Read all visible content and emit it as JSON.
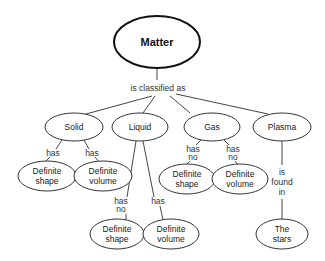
{
  "diagram": {
    "root": {
      "label": "Matter"
    },
    "root_link": {
      "label": "is classified as"
    },
    "categories": [
      {
        "label": "Solid"
      },
      {
        "label": "Liquid"
      },
      {
        "label": "Gas"
      },
      {
        "label": "Plasma"
      }
    ],
    "solid": {
      "links": [
        {
          "line1": "has"
        },
        {
          "line1": "has"
        }
      ],
      "children": [
        {
          "line1": "Definite",
          "line2": "shape"
        },
        {
          "line1": "Definite",
          "line2": "volume"
        }
      ]
    },
    "liquid": {
      "links": [
        {
          "line1": "has",
          "line2": "no"
        },
        {
          "line1": "has"
        }
      ],
      "children": [
        {
          "line1": "Definite",
          "line2": "shape"
        },
        {
          "line1": "Definite",
          "line2": "volume"
        }
      ]
    },
    "gas": {
      "links": [
        {
          "line1": "has",
          "line2": "no"
        },
        {
          "line1": "has",
          "line2": "no"
        }
      ],
      "children": [
        {
          "line1": "Definite",
          "line2": "shape"
        },
        {
          "line1": "Definite",
          "line2": "volume"
        }
      ]
    },
    "plasma": {
      "link": {
        "line1": "is",
        "line2": "found",
        "line3": "in"
      },
      "child": {
        "line1": "The",
        "line2": "stars"
      }
    }
  }
}
